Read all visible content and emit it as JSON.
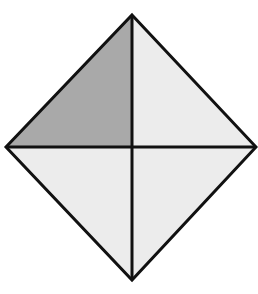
{
  "diagram": {
    "shape": "diamond",
    "vertices": {
      "top": [
        132,
        15
      ],
      "right": [
        256,
        147
      ],
      "bottom": [
        132,
        280
      ],
      "left": [
        6,
        147
      ],
      "center": [
        132,
        147
      ]
    },
    "regions": [
      {
        "id": "top-left",
        "shaded": true,
        "fill": "#a9a9a9"
      },
      {
        "id": "top-right",
        "shaded": false,
        "fill": "#ececec"
      },
      {
        "id": "bottom-left",
        "shaded": false,
        "fill": "#ececec"
      },
      {
        "id": "bottom-right",
        "shaded": false,
        "fill": "#ececec"
      }
    ],
    "stroke": "#111111",
    "shaded_fraction": "1/4"
  }
}
